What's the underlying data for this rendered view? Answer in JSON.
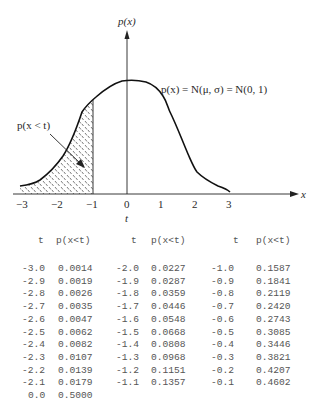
{
  "chart_data": {
    "type": "line",
    "title": "",
    "xlabel": "x",
    "ylabel": "p(x)",
    "x_ticks": [
      "-3",
      "-2",
      "-1",
      "0",
      "1",
      "2",
      "3"
    ],
    "xlim": [
      -3.3,
      5.2
    ],
    "t_marker_label": "t",
    "t_value": -1,
    "curve_label": "p(x) = N(μ, σ) = N(0, 1)",
    "shaded_label": "p(x < t)",
    "shaded_region": {
      "from": -3,
      "to": -1,
      "pattern": "dashed hatch"
    },
    "x": [
      -3,
      -2.5,
      -2,
      -1.5,
      -1,
      -0.5,
      0,
      0.5,
      1,
      1.5,
      2,
      2.5,
      3
    ],
    "values": [
      0.004,
      0.018,
      0.054,
      0.13,
      0.242,
      0.352,
      0.399,
      0.352,
      0.242,
      0.13,
      0.054,
      0.018,
      0.004
    ],
    "table": {
      "columns": [
        "t",
        "p(x<t)"
      ],
      "rows": [
        [
          -3.0,
          0.0014
        ],
        [
          -2.9,
          0.0019
        ],
        [
          -2.8,
          0.0026
        ],
        [
          -2.7,
          0.0035
        ],
        [
          -2.6,
          0.0047
        ],
        [
          -2.5,
          0.0062
        ],
        [
          -2.4,
          0.0082
        ],
        [
          -2.3,
          0.0107
        ],
        [
          -2.2,
          0.0139
        ],
        [
          -2.1,
          0.0179
        ],
        [
          -2.0,
          0.0227
        ],
        [
          -1.9,
          0.0287
        ],
        [
          -1.8,
          0.0359
        ],
        [
          -1.7,
          0.0446
        ],
        [
          -1.6,
          0.0548
        ],
        [
          -1.5,
          0.0668
        ],
        [
          -1.4,
          0.0808
        ],
        [
          -1.3,
          0.0968
        ],
        [
          -1.2,
          0.1151
        ],
        [
          -1.1,
          0.1357
        ],
        [
          -1.0,
          0.1587
        ],
        [
          -0.9,
          0.1841
        ],
        [
          -0.8,
          0.2119
        ],
        [
          -0.7,
          0.242
        ],
        [
          -0.6,
          0.2743
        ],
        [
          -0.5,
          0.3085
        ],
        [
          -0.4,
          0.3446
        ],
        [
          -0.3,
          0.3821
        ],
        [
          -0.2,
          0.4207
        ],
        [
          -0.1,
          0.4602
        ],
        [
          0.0,
          0.5
        ]
      ]
    }
  },
  "labels": {
    "y_axis": "p(x)",
    "x_axis": "x",
    "t_marker": "t",
    "curve": "p(x) = N(μ, σ) = N(0, 1)",
    "shaded": "p(x < t)",
    "ticks": [
      "−3",
      "−2",
      "−1",
      "0",
      "1",
      "2",
      "3"
    ]
  },
  "table": {
    "headers": [
      {
        "t": "t",
        "p": "p(x<t)"
      },
      {
        "t": "t",
        "p": "p(x<t)"
      },
      {
        "t": "t",
        "p": "p(x<t)"
      }
    ],
    "col1": [
      {
        "t": "-3.0",
        "p": "0.0014"
      },
      {
        "t": "-2.9",
        "p": "0.0019"
      },
      {
        "t": "-2.8",
        "p": "0.0026"
      },
      {
        "t": "-2.7",
        "p": "0.0035"
      },
      {
        "t": "-2.6",
        "p": "0.0047"
      },
      {
        "t": "-2.5",
        "p": "0.0062"
      },
      {
        "t": "-2.4",
        "p": "0.0082"
      },
      {
        "t": "-2.3",
        "p": "0.0107"
      },
      {
        "t": "-2.2",
        "p": "0.0139"
      },
      {
        "t": "-2.1",
        "p": "0.0179"
      },
      {
        "t": "0.0",
        "p": "0.5000"
      }
    ],
    "col2": [
      {
        "t": "-2.0",
        "p": "0.0227"
      },
      {
        "t": "-1.9",
        "p": "0.0287"
      },
      {
        "t": "-1.8",
        "p": "0.0359"
      },
      {
        "t": "-1.7",
        "p": "0.0446"
      },
      {
        "t": "-1.6",
        "p": "0.0548"
      },
      {
        "t": "-1.5",
        "p": "0.0668"
      },
      {
        "t": "-1.4",
        "p": "0.0808"
      },
      {
        "t": "-1.3",
        "p": "0.0968"
      },
      {
        "t": "-1.2",
        "p": "0.1151"
      },
      {
        "t": "-1.1",
        "p": "0.1357"
      }
    ],
    "col3": [
      {
        "t": "-1.0",
        "p": "0.1587"
      },
      {
        "t": "-0.9",
        "p": "0.1841"
      },
      {
        "t": "-0.8",
        "p": "0.2119"
      },
      {
        "t": "-0.7",
        "p": "0.2420"
      },
      {
        "t": "-0.6",
        "p": "0.2743"
      },
      {
        "t": "-0.5",
        "p": "0.3085"
      },
      {
        "t": "-0.4",
        "p": "0.3446"
      },
      {
        "t": "-0.3",
        "p": "0.3821"
      },
      {
        "t": "-0.2",
        "p": "0.4207"
      },
      {
        "t": "-0.1",
        "p": "0.4602"
      }
    ]
  }
}
